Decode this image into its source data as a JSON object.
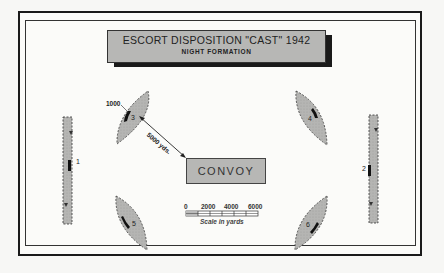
{
  "title": {
    "main": "ESCORT DISPOSITION \"CAST\" 1942",
    "subtitle": "NIGHT FORMATION"
  },
  "convoy": {
    "label": "CONVOY"
  },
  "escorts": [
    {
      "id": "1",
      "shape": "rectangle",
      "position": "left"
    },
    {
      "id": "2",
      "shape": "rectangle",
      "position": "right"
    },
    {
      "id": "3",
      "shape": "lens",
      "position": "upper-left"
    },
    {
      "id": "4",
      "shape": "lens",
      "position": "upper-right"
    },
    {
      "id": "5",
      "shape": "lens",
      "position": "lower-left"
    },
    {
      "id": "6",
      "shape": "lens",
      "position": "lower-right"
    }
  ],
  "annotations": {
    "patrol_width": "1000",
    "distance": "5000 yds."
  },
  "scale": {
    "ticks": [
      "0",
      "2000",
      "4000",
      "6000"
    ],
    "caption": "Scale in yards"
  },
  "colors": {
    "fill": "#b7b7b5",
    "ink": "#1a1a1a"
  }
}
